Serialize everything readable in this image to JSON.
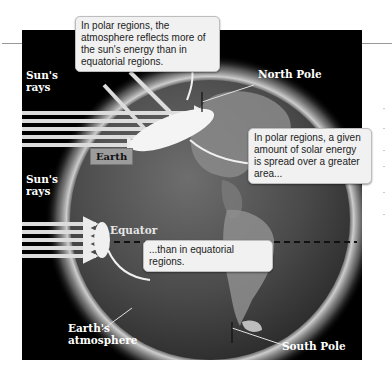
{
  "figure": {
    "labels": {
      "suns_rays_top": "Sun's rays",
      "suns_rays_bottom": "Sun's rays",
      "north_pole": "North Pole",
      "south_pole": "South Pole",
      "equator": "Equator",
      "earth": "Earth",
      "earths_atmosphere": "Earth's atmosphere"
    },
    "callouts": {
      "polar_reflect": "In polar regions, the atmosphere reflects more of the sun's energy than in equatorial regions.",
      "polar_spread": "In polar regions, a given amount of solar energy is spread over a greater area...",
      "equatorial": "...than in equatorial regions."
    },
    "colors": {
      "background": "#000000",
      "callout_fill": "#f1f1f1",
      "earth_tag_fill": "#9c9c9c",
      "atmosphere_glow": "#cfcfcf",
      "ray_fill": "#d9d9d9"
    },
    "ray_groups": {
      "polar_ray_count": 5,
      "equatorial_ray_count": 5,
      "reflected_ray_count": 2
    }
  }
}
